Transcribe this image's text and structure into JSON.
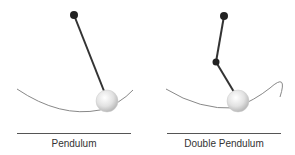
{
  "panels": [
    {
      "id": "pendulum",
      "label": "Pendulum"
    },
    {
      "id": "double-pendulum",
      "label": "Double Pendulum"
    }
  ],
  "colors": {
    "rod": "#333333",
    "pivot": "#222222",
    "trajectory": "#888888",
    "bob_light": "#ffffff",
    "bob_dark": "#bbbbbb",
    "rule": "#555555",
    "text": "#333333"
  }
}
